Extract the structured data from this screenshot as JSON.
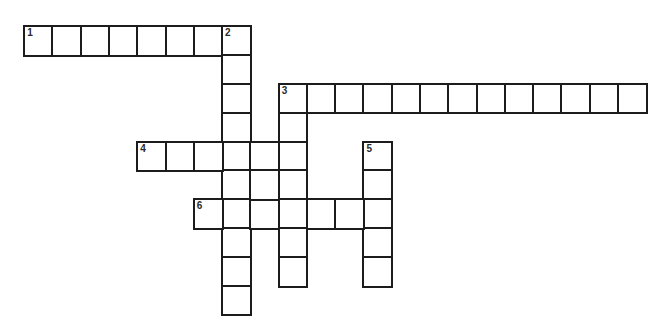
{
  "puzzle": {
    "type": "crossword",
    "rows": 10,
    "cols": 22
  },
  "clues": [
    {
      "number": "1",
      "direction": "across",
      "row": 0,
      "col": 0,
      "length": 8
    },
    {
      "number": "2",
      "direction": "down",
      "row": 0,
      "col": 7,
      "length": 10
    },
    {
      "number": "3",
      "direction": "across",
      "row": 2,
      "col": 9,
      "length": 13
    },
    {
      "number": "3",
      "direction": "down",
      "row": 2,
      "col": 9,
      "length": 7
    },
    {
      "number": "4",
      "direction": "across",
      "row": 4,
      "col": 4,
      "length": 6
    },
    {
      "number": "5",
      "direction": "down",
      "row": 4,
      "col": 12,
      "length": 5
    },
    {
      "number": "6",
      "direction": "across",
      "row": 6,
      "col": 6,
      "length": 7
    }
  ],
  "extra_cells": [
    {
      "row": 5,
      "col": 8
    }
  ],
  "numbers": [
    {
      "label": "1",
      "row": 0,
      "col": 0
    },
    {
      "label": "2",
      "row": 0,
      "col": 7
    },
    {
      "label": "3",
      "row": 2,
      "col": 9
    },
    {
      "label": "4",
      "row": 4,
      "col": 4
    },
    {
      "label": "5",
      "row": 4,
      "col": 12
    },
    {
      "label": "6",
      "row": 6,
      "col": 6
    }
  ]
}
